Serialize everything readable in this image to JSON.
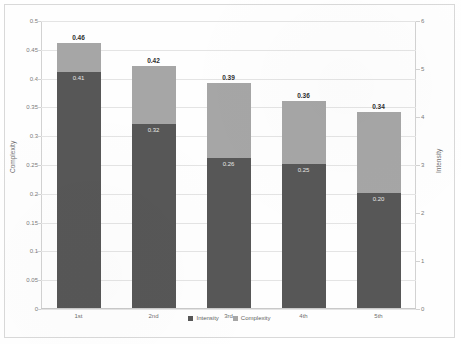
{
  "chart_data": {
    "type": "bar",
    "title": "",
    "subtitle": "",
    "xlabel": "",
    "ylabel": "Complexity",
    "y2label": "Intensity",
    "categories": [
      "1st",
      "2nd",
      "3rd",
      "4th",
      "5th"
    ],
    "stacked": true,
    "grid": true,
    "legend_position": "bottom-center",
    "ylim": [
      0,
      0.5
    ],
    "y2lim": [
      0,
      6
    ],
    "yticks": [
      "0",
      "0.05",
      "0.1",
      "0.15",
      "0.2",
      "0.25",
      "0.3",
      "0.35",
      "0.4",
      "0.45",
      "0.5"
    ],
    "y2ticks": [
      "0",
      "1",
      "2",
      "3",
      "4",
      "5",
      "6"
    ],
    "series": [
      {
        "name": "Intensity",
        "color": "#575757",
        "axis": "left",
        "values": [
          0.41,
          0.32,
          0.26,
          0.25,
          0.2
        ],
        "labels": [
          "0.41",
          "0.32",
          "0.26",
          "0.25",
          "0.20"
        ]
      },
      {
        "name": "Complexity",
        "color": "#a6a6a6",
        "axis": "left",
        "values": [
          0.05,
          0.1,
          0.13,
          0.11,
          0.14
        ],
        "labels": [
          "",
          "",
          "",
          "",
          ""
        ]
      }
    ],
    "totals": [
      0.46,
      0.42,
      0.39,
      0.36,
      0.34
    ],
    "total_labels": [
      "0.46",
      "0.42",
      "0.39",
      "0.36",
      "0.34"
    ]
  },
  "legend": {
    "items": [
      {
        "label": "Intensity",
        "color": "#575757"
      },
      {
        "label": "Complexity",
        "color": "#a6a6a6"
      }
    ]
  }
}
